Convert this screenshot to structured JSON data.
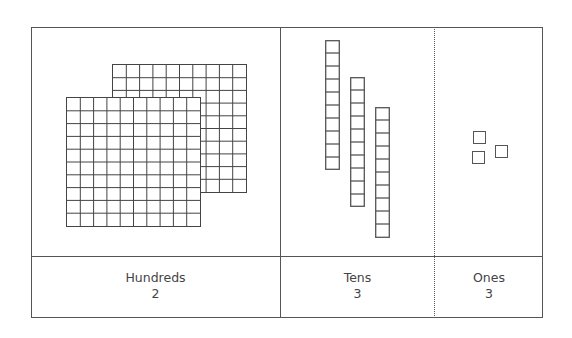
{
  "columns": [
    {
      "name": "Hundreds",
      "value": "2",
      "block_type": "flat (10x10)",
      "count": 2
    },
    {
      "name": "Tens",
      "value": "3",
      "block_type": "rod (1x10)",
      "count": 3
    },
    {
      "name": "Ones",
      "value": "3",
      "block_type": "unit cube",
      "count": 3
    }
  ],
  "represented_number": 233,
  "colors": {
    "border": "#555555",
    "grid_line": "#444444",
    "text": "#444444",
    "background": "#ffffff"
  }
}
